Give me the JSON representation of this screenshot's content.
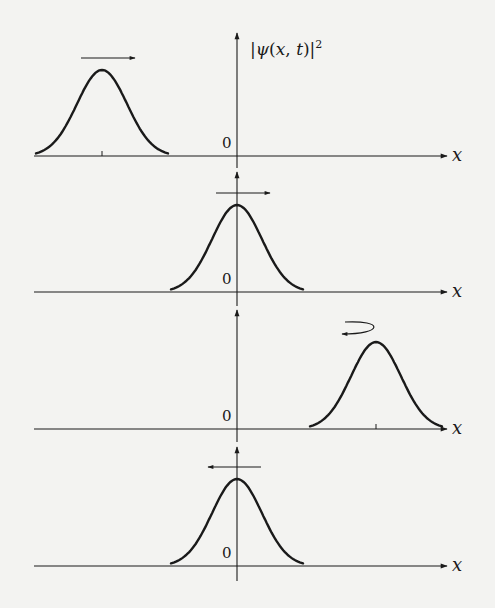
{
  "figure": {
    "y_axis_label": "|ψ(x,t)|²",
    "x_axis_label": "x",
    "origin_label": "0"
  },
  "panels": [
    {
      "id": "t1",
      "peak_x": 102,
      "baseline_y": 156,
      "peak_y": 70,
      "axis_top": 33,
      "axis_bottom": 168,
      "tick": true,
      "arrow": "right",
      "arrow_desc": "packet moving right (toward origin)"
    },
    {
      "id": "t2",
      "peak_x": 237,
      "baseline_y": 292,
      "peak_y": 205,
      "axis_top": 172,
      "axis_bottom": 306,
      "tick": false,
      "arrow": "right",
      "arrow_desc": "packet centered at origin, moving right"
    },
    {
      "id": "t3",
      "peak_x": 376,
      "baseline_y": 429,
      "peak_y": 342,
      "axis_top": 310,
      "axis_bottom": 442,
      "tick": true,
      "arrow": "reverse",
      "arrow_desc": "packet reversing direction (curved arrow)"
    },
    {
      "id": "t4",
      "peak_x": 237,
      "baseline_y": 566,
      "peak_y": 479,
      "axis_top": 447,
      "axis_bottom": 581,
      "tick": false,
      "arrow": "left",
      "arrow_desc": "packet back at origin, moving left"
    }
  ],
  "colors": {
    "ink": "#1a1a1a",
    "background": "#f3f3f1"
  }
}
